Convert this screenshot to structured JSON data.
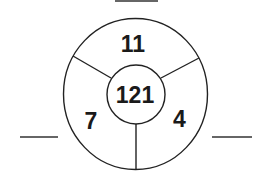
{
  "puzzle": {
    "center_value": "121",
    "segments": [
      {
        "position": "top",
        "value": "11"
      },
      {
        "position": "bottom-left",
        "value": "7"
      },
      {
        "position": "bottom-right",
        "value": "4"
      }
    ],
    "answer_blanks": [
      {
        "position": "top",
        "value": ""
      },
      {
        "position": "left",
        "value": ""
      },
      {
        "position": "right",
        "value": ""
      }
    ]
  },
  "colors": {
    "line": "#222222",
    "text": "#1a1a1a",
    "background": "#ffffff"
  }
}
